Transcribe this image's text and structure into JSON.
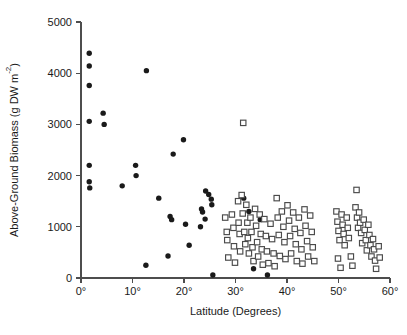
{
  "chart_data": {
    "type": "scatter",
    "title": "",
    "xlabel": "Latitude (Degrees)",
    "ylabel": "Above-Ground Biomass (g DW m-2)",
    "ylabel_parts": {
      "main": "Above-Ground Biomass (g DW m",
      "superscript": "-2",
      "tail": ")"
    },
    "xlim": [
      0,
      60
    ],
    "ylim": [
      0,
      5000
    ],
    "grid": false,
    "legend": "none",
    "xticks": [
      0,
      10,
      20,
      30,
      40,
      50,
      60
    ],
    "xtick_labels": [
      "0°",
      "10°",
      "20°",
      "30°",
      "40°",
      "50°",
      "60°"
    ],
    "yticks": [
      0,
      1000,
      2000,
      3000,
      4000,
      5000
    ],
    "ytick_labels": [
      "0",
      "1000",
      "2000",
      "3000",
      "4000",
      "5000"
    ],
    "series": [
      {
        "name": "filled-circles",
        "marker": "circle",
        "fill": "#1a1a1a",
        "stroke": "none",
        "points": [
          [
            1.6,
            4390
          ],
          [
            1.6,
            4140
          ],
          [
            1.6,
            3760
          ],
          [
            1.6,
            3060
          ],
          [
            1.6,
            2200
          ],
          [
            1.6,
            1880
          ],
          [
            1.7,
            1760
          ],
          [
            4.3,
            3220
          ],
          [
            4.5,
            3000
          ],
          [
            8.0,
            1800
          ],
          [
            10.6,
            2200
          ],
          [
            10.7,
            2000
          ],
          [
            12.7,
            4050
          ],
          [
            12.6,
            250
          ],
          [
            15.1,
            1560
          ],
          [
            16.9,
            430
          ],
          [
            17.3,
            1200
          ],
          [
            17.6,
            1140
          ],
          [
            19.9,
            2700
          ],
          [
            17.9,
            2420
          ],
          [
            20.3,
            1050
          ],
          [
            21.0,
            640
          ],
          [
            24.2,
            1700
          ],
          [
            24.8,
            1630
          ],
          [
            25.3,
            1540
          ],
          [
            25.4,
            1430
          ],
          [
            23.4,
            1350
          ],
          [
            23.6,
            1290
          ],
          [
            24.1,
            1150
          ],
          [
            23.2,
            1000
          ],
          [
            25.6,
            60
          ],
          [
            31.6,
            1560
          ],
          [
            32.6,
            1300
          ],
          [
            34.8,
            1140
          ],
          [
            33.5,
            180
          ],
          [
            36.2,
            60
          ]
        ]
      },
      {
        "name": "open-squares",
        "marker": "square",
        "fill": "#ffffff",
        "stroke": "#4a4a4a",
        "points": [
          [
            31.5,
            3030
          ],
          [
            28.0,
            1180
          ],
          [
            28.3,
            900
          ],
          [
            28.4,
            740
          ],
          [
            28.6,
            400
          ],
          [
            29.3,
            1240
          ],
          [
            29.6,
            980
          ],
          [
            29.7,
            620
          ],
          [
            29.9,
            300
          ],
          [
            30.5,
            1500
          ],
          [
            30.6,
            1080
          ],
          [
            30.8,
            860
          ],
          [
            30.9,
            520
          ],
          [
            31.2,
            1620
          ],
          [
            31.4,
            1260
          ],
          [
            31.7,
            900
          ],
          [
            31.9,
            660
          ],
          [
            32.1,
            1430
          ],
          [
            32.3,
            1080
          ],
          [
            32.4,
            780
          ],
          [
            32.6,
            480
          ],
          [
            32.9,
            1180
          ],
          [
            33.1,
            900
          ],
          [
            33.3,
            600
          ],
          [
            33.5,
            330
          ],
          [
            33.8,
            1350
          ],
          [
            34.0,
            1020
          ],
          [
            34.2,
            700
          ],
          [
            34.4,
            420
          ],
          [
            34.7,
            1240
          ],
          [
            34.9,
            860
          ],
          [
            35.1,
            560
          ],
          [
            35.3,
            260
          ],
          [
            35.6,
            1150
          ],
          [
            35.9,
            820
          ],
          [
            36.1,
            520
          ],
          [
            36.4,
            290
          ],
          [
            36.8,
            1060
          ],
          [
            37.1,
            760
          ],
          [
            37.4,
            480
          ],
          [
            37.6,
            230
          ],
          [
            38.0,
            1560
          ],
          [
            38.2,
            1180
          ],
          [
            38.4,
            840
          ],
          [
            38.6,
            430
          ],
          [
            39.0,
            1300
          ],
          [
            39.3,
            1000
          ],
          [
            39.5,
            700
          ],
          [
            39.7,
            370
          ],
          [
            40.1,
            1420
          ],
          [
            40.4,
            1120
          ],
          [
            40.6,
            820
          ],
          [
            40.8,
            480
          ],
          [
            41.2,
            1280
          ],
          [
            41.5,
            960
          ],
          [
            41.7,
            660
          ],
          [
            41.9,
            330
          ],
          [
            42.3,
            1180
          ],
          [
            42.6,
            880
          ],
          [
            42.8,
            560
          ],
          [
            43.0,
            280
          ],
          [
            43.4,
            1340
          ],
          [
            43.6,
            1020
          ],
          [
            43.9,
            720
          ],
          [
            44.1,
            420
          ],
          [
            44.5,
            1220
          ],
          [
            44.8,
            900
          ],
          [
            45.0,
            600
          ],
          [
            45.3,
            330
          ],
          [
            49.6,
            1300
          ],
          [
            49.8,
            1100
          ],
          [
            50.0,
            920
          ],
          [
            50.2,
            740
          ],
          [
            50.6,
            1240
          ],
          [
            50.8,
            1040
          ],
          [
            51.0,
            860
          ],
          [
            51.2,
            640
          ],
          [
            51.6,
            1180
          ],
          [
            51.8,
            980
          ],
          [
            52.0,
            780
          ],
          [
            53.5,
            1720
          ],
          [
            53.3,
            1380
          ],
          [
            53.6,
            1180
          ],
          [
            53.8,
            980
          ],
          [
            54.0,
            1280
          ],
          [
            54.2,
            1080
          ],
          [
            54.4,
            880
          ],
          [
            54.6,
            680
          ],
          [
            54.9,
            1140
          ],
          [
            55.1,
            940
          ],
          [
            55.3,
            740
          ],
          [
            55.5,
            540
          ],
          [
            55.8,
            1040
          ],
          [
            56.0,
            840
          ],
          [
            56.2,
            640
          ],
          [
            56.4,
            420
          ],
          [
            56.7,
            760
          ],
          [
            56.9,
            560
          ],
          [
            57.1,
            340
          ],
          [
            57.3,
            180
          ],
          [
            57.8,
            620
          ],
          [
            58.0,
            400
          ],
          [
            52.4,
            420
          ],
          [
            52.7,
            240
          ],
          [
            49.9,
            380
          ],
          [
            50.4,
            200
          ]
        ]
      }
    ]
  }
}
